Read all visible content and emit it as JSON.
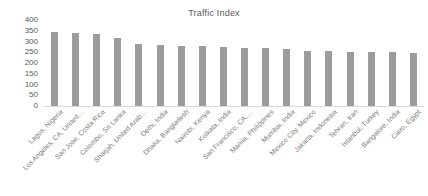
{
  "chart_data": {
    "type": "bar",
    "title": "Traffic Index",
    "xlabel": "",
    "ylabel": "",
    "ylim": [
      0,
      400
    ],
    "yticks": [
      400,
      350,
      300,
      250,
      200,
      150,
      100,
      50,
      0
    ],
    "grid": false,
    "legend": false,
    "bar_color": "#9c9c9c",
    "categories": [
      "Lagos, Nigeria",
      "Los Angeles, CA, United…",
      "San Jose, Costa Rica",
      "Colombo, Sri Lanka",
      "Sharjah, United Arab…",
      "Delhi, India",
      "Dhaka, Bangladesh",
      "Nairobi, Kenya",
      "Kolkata, India",
      "San Francisco, CA,…",
      "Manila, Philippines",
      "Mumbai, India",
      "Mexico City, Mexico",
      "Jakarta, Indonesia",
      "Tehran, Iran",
      "Istanbul, Turkey",
      "Bangalore, India",
      "Cairo, Egypt"
    ],
    "values": [
      345,
      338,
      335,
      318,
      288,
      282,
      278,
      277,
      276,
      272,
      270,
      264,
      255,
      254,
      251,
      251,
      250,
      248
    ]
  }
}
